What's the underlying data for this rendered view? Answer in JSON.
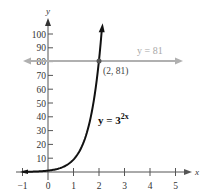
{
  "chart_data": {
    "type": "line",
    "title": "",
    "xlabel": "x",
    "ylabel": "y",
    "xlim": [
      -1,
      5.5
    ],
    "ylim": [
      0,
      110
    ],
    "x_ticks": [
      -1,
      0,
      1,
      2,
      3,
      4,
      5
    ],
    "y_ticks": [
      10,
      20,
      30,
      40,
      50,
      60,
      70,
      80,
      90,
      100
    ],
    "grid": false,
    "series": [
      {
        "name": "y = 3^{2x}",
        "expression": "3^(2x)",
        "color": "#111111",
        "x": [
          -1,
          -0.5,
          0,
          0.5,
          1,
          1.5,
          2,
          2.1
        ],
        "values": [
          0.111,
          0.333,
          1,
          3,
          9,
          27,
          81,
          100.9
        ]
      },
      {
        "name": "y = 81",
        "expression": "81",
        "color": "#a8a8a8",
        "x": [
          -1,
          5.2
        ],
        "values": [
          81,
          81
        ]
      }
    ],
    "annotations": [
      {
        "text": "(2, 81)",
        "x": 2,
        "y": 81,
        "type": "intersection-point"
      },
      {
        "text": "y = 81",
        "type": "line-label"
      },
      {
        "text": "y = 3",
        "superscript": "2x",
        "type": "curve-label"
      }
    ]
  },
  "labels": {
    "x_axis": "x",
    "y_axis": "y",
    "x_ticks": [
      "−1",
      "0",
      "1",
      "2",
      "3",
      "4",
      "5"
    ],
    "y_ticks": [
      "10",
      "20",
      "30",
      "40",
      "50",
      "60",
      "70",
      "80",
      "90",
      "100"
    ],
    "horizontal_line": "y = 81",
    "point": "(2, 81)",
    "curve_base": "y = 3",
    "curve_exp": "2x"
  }
}
